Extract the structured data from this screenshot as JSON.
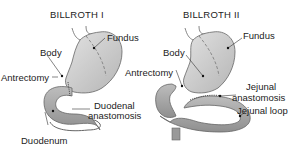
{
  "figure": {
    "left": {
      "title": "BILLROTH I",
      "labels": {
        "fundus": "Fundus",
        "body": "Body",
        "antrectomy": "Antrectomy",
        "anastomosis_line1": "Duodenal",
        "anastomosis_line2": "anastomosis",
        "duodenum": "Duodenum"
      }
    },
    "right": {
      "title": "BILLROTH II",
      "labels": {
        "fundus": "Fundus",
        "body": "Body",
        "antrectomy": "Antrectomy",
        "anastomosis_line1": "Jejunal",
        "anastomosis_line2": "anastomosis",
        "jejunal_loop": "Jejunal loop"
      }
    },
    "colors": {
      "stomach_fill": "#c9c9c9",
      "bowel_fill": "#a8a8a8",
      "outline": "#555555",
      "text": "#222222"
    }
  }
}
